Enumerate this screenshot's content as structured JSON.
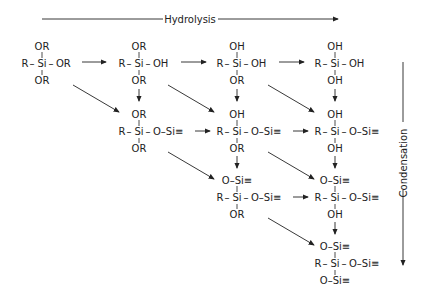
{
  "header": {
    "hydrolysis": "Hydrolysis"
  },
  "side": {
    "condensation": "Condensation"
  },
  "molecules": [
    {
      "id": "m1",
      "top": "OR",
      "left": "R",
      "right": "OR",
      "bottom": "OR"
    },
    {
      "id": "m2",
      "top": "OR",
      "left": "R",
      "right": "OH",
      "bottom": "OR"
    },
    {
      "id": "m3",
      "top": "OH",
      "left": "R",
      "right": "OH",
      "bottom": "OR"
    },
    {
      "id": "m4",
      "top": "OH",
      "left": "R",
      "right": "OH",
      "bottom": "OH"
    },
    {
      "id": "m5",
      "top": "OR",
      "left": "R",
      "right": "O–Si≡",
      "bottom": "OR"
    },
    {
      "id": "m6",
      "top": "OH",
      "left": "R",
      "right": "O–Si≡",
      "bottom": "OR"
    },
    {
      "id": "m7",
      "top": "OH",
      "left": "R",
      "right": "O–Si≡",
      "bottom": "OH"
    },
    {
      "id": "m8",
      "top": "O–Si≡",
      "left": "R",
      "right": "O–Si≡",
      "bottom": "OR"
    },
    {
      "id": "m9",
      "top": "O–Si≡",
      "left": "R",
      "right": "O–Si≡",
      "bottom": "OH"
    },
    {
      "id": "m10",
      "top": "O–Si≡",
      "left": "R",
      "right": "O–Si≡",
      "bottom": "O–Si≡"
    }
  ],
  "center_atom": "Si"
}
